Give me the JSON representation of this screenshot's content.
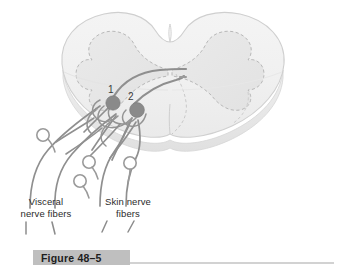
{
  "figure": {
    "caption_label": "Figure 48–5",
    "background_color": "#ffffff"
  },
  "labels": {
    "visceral": "Visceral\nnerve fibers",
    "skin": "Skin nerve\nfibers",
    "neuron_1": "1",
    "neuron_2": "2"
  },
  "colors": {
    "cord_fill": "#f2f2f2",
    "cord_outline": "#cfcfcf",
    "gray_matter_fill": "#e8e8e8",
    "gray_matter_outline": "#b8b8b8",
    "slab_edge": "#e6e6e6",
    "fiber_stroke": "#8f8f8f",
    "cell_body_fill": "#8a8a8a",
    "ganglion_fill": "#ffffff",
    "ganglion_stroke": "#9a9a9a",
    "caption_band": "#bfbfbf",
    "caption_text": "#1d1d1d",
    "rule": "#d2d2d2",
    "label_text": "#2b2b2b"
  },
  "anatomy": {
    "structures": [
      "spinal cord cross-section",
      "gray matter butterfly (dashed outline)",
      "dorsal median sulcus notch",
      "ventral median fissure",
      "3D slab edge (inferior rim)"
    ],
    "neurons": [
      {
        "id": "1",
        "type": "dorsal-horn-neuron",
        "shade": "#8a8a8a"
      },
      {
        "id": "2",
        "type": "dorsal-horn-neuron",
        "shade": "#8a8a8a"
      }
    ],
    "ganglion_cell_count": 4,
    "ascending_tract_count": 2,
    "leader_dash_count": 4
  }
}
